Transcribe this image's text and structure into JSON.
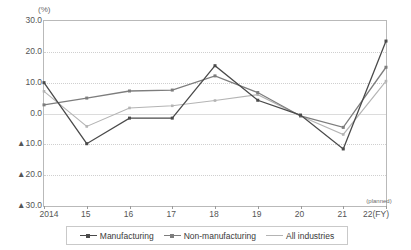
{
  "axis": {
    "unit_label": "(%)",
    "y_ticks": [
      "30.0",
      "20.0",
      "10.0",
      "0.0",
      "▲10.0",
      "▲20.0",
      "▲30.0"
    ],
    "y_values": [
      30,
      20,
      10,
      0,
      -10,
      -20,
      -30
    ],
    "x_ticks": [
      "2014",
      "15",
      "16",
      "17",
      "18",
      "19",
      "20",
      "21",
      "22(FY)"
    ],
    "planned_note": "(planned)"
  },
  "legend": {
    "items": [
      {
        "label": "Manufacturing",
        "color": "#4a4a4a"
      },
      {
        "label": "Non-manufacturing",
        "color": "#7d7d7d"
      },
      {
        "label": "All industries",
        "color": "#b4b4b4"
      }
    ]
  },
  "source_note": "",
  "chart_data": {
    "type": "line",
    "title": "",
    "xlabel": "(FY)",
    "ylabel": "(%)",
    "ylim": [
      -30,
      30
    ],
    "grid": true,
    "legend_position": "bottom",
    "categories": [
      "2014",
      "15",
      "16",
      "17",
      "18",
      "19",
      "20",
      "21",
      "22"
    ],
    "annotations": [
      "(planned)"
    ],
    "series": [
      {
        "name": "Manufacturing",
        "color": "#4a4a4a",
        "values": [
          10.0,
          -9.8,
          -1.5,
          -1.5,
          15.5,
          4.3,
          -0.5,
          -11.5,
          23.5
        ]
      },
      {
        "name": "Non-manufacturing",
        "color": "#7d7d7d",
        "values": [
          2.8,
          5.0,
          7.3,
          7.6,
          12.2,
          6.8,
          -0.8,
          -4.5,
          15.0
        ]
      },
      {
        "name": "All industries",
        "color": "#b4b4b4",
        "values": [
          7.2,
          -4.2,
          1.8,
          2.5,
          4.2,
          6.1,
          -0.8,
          -6.8,
          10.5
        ]
      }
    ]
  }
}
